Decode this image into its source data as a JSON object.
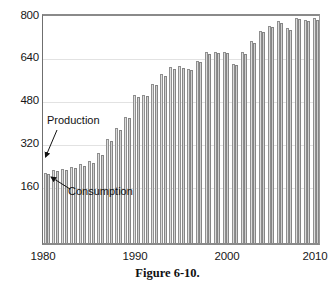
{
  "caption": "Figure 6-10.",
  "chart_data": {
    "type": "bar",
    "title": "",
    "subtitle": "",
    "xlabel": "",
    "ylabel": "",
    "grid": true,
    "legend_position": "annotations-in-plot",
    "ylim": [
      0,
      800
    ],
    "xlim": [
      1980,
      2010
    ],
    "ytick_labels": [
      "800",
      "640",
      "480",
      "320",
      "160"
    ],
    "ytick_values": [
      800,
      640,
      480,
      320,
      160
    ],
    "xtick_labels": [
      "1980",
      "1990",
      "2000",
      "2010"
    ],
    "xtick_values": [
      1980,
      1990,
      2000,
      2010
    ],
    "annotations": [
      {
        "text": "Production",
        "points_to": "first-production-bar"
      },
      {
        "text": "Consumption",
        "points_to": "first-consumption-bar"
      }
    ],
    "categories": [
      1980,
      1981,
      1982,
      1983,
      1984,
      1985,
      1986,
      1987,
      1988,
      1989,
      1990,
      1991,
      1992,
      1993,
      1994,
      1995,
      1996,
      1997,
      1998,
      1999,
      2000,
      2001,
      2002,
      2003,
      2004,
      2005,
      2006,
      2007,
      2008,
      2009,
      2010
    ],
    "series": [
      {
        "name": "Production",
        "values": [
          243,
          253,
          258,
          264,
          272,
          283,
          312,
          361,
          398,
          438,
          512,
          512,
          552,
          585,
          608,
          612,
          603,
          632,
          660,
          662,
          663,
          620,
          661,
          700,
          735,
          752,
          768,
          743,
          780,
          772,
          778
        ]
      },
      {
        "name": "Consumption",
        "values": [
          238,
          248,
          253,
          259,
          268,
          278,
          306,
          354,
          392,
          432,
          505,
          508,
          546,
          578,
          602,
          606,
          598,
          626,
          655,
          658,
          659,
          615,
          656,
          694,
          730,
          747,
          762,
          738,
          775,
          768,
          774
        ]
      }
    ]
  },
  "colors": {
    "production_bar": "#cfcfcf",
    "consumption_bar": "#c2c2c2",
    "bar_outline": "#8f8f8f",
    "gridline": "#e2e2e2",
    "frame": "#8a8a8a",
    "text": "#171717"
  }
}
